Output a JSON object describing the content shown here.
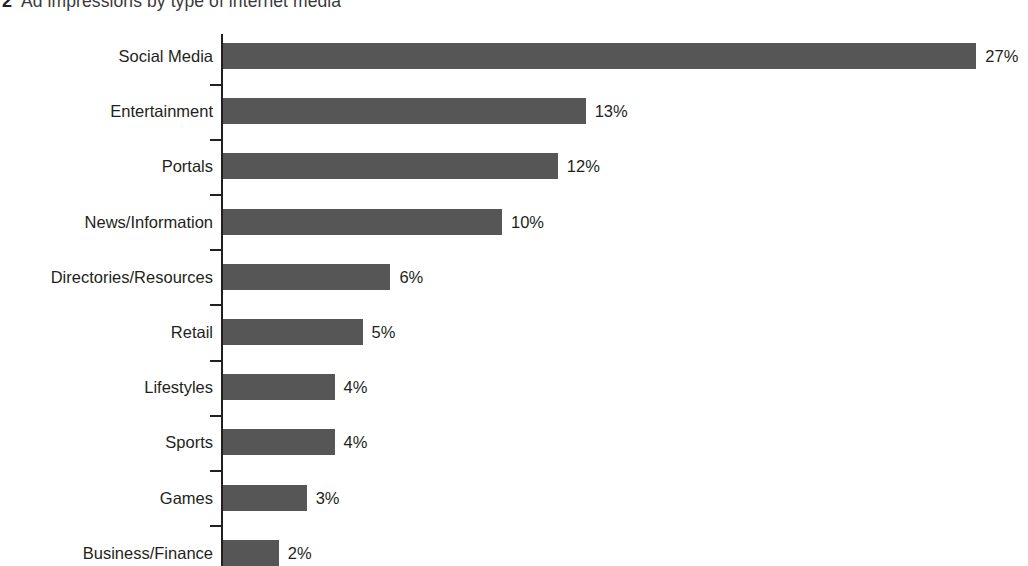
{
  "title": {
    "number": "2",
    "text": "Ad impressions by type of internet media"
  },
  "colors": {
    "bar": "#565656",
    "axis": "#231f20",
    "text": "#231f20",
    "title_text": "#3a3a3a",
    "background": "#ffffff"
  },
  "chart_data": {
    "type": "bar",
    "orientation": "horizontal",
    "title": "2 Ad impressions by type of internet media",
    "xlabel": "",
    "ylabel": "",
    "xlim": [
      0,
      27
    ],
    "grid": false,
    "legend": null,
    "value_suffix": "%",
    "categories": [
      "Social Media",
      "Entertainment",
      "Portals",
      "News/Information",
      "Directories/Resources",
      "Retail",
      "Lifestyles",
      "Sports",
      "Games",
      "Business/Finance"
    ],
    "values": [
      27,
      13,
      12,
      10,
      6,
      5,
      4,
      4,
      3,
      2
    ],
    "data_labels": [
      "27%",
      "13%",
      "12%",
      "10%",
      "6%",
      "5%",
      "4%",
      "4%",
      "3%",
      "2%"
    ]
  }
}
